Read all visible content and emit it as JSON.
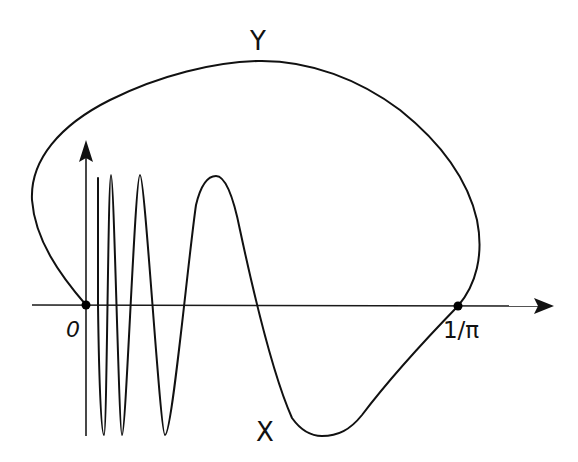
{
  "figure": {
    "width": 578,
    "height": 462,
    "background": "#ffffff",
    "ink": "#111111",
    "labels": {
      "curve_top": "Y",
      "curve_bottom": "X",
      "origin": "0",
      "endpoint": "1/π"
    },
    "axes": {
      "x_axis": {
        "from": [
          32,
          305
        ],
        "to": [
          553,
          306
        ],
        "arrow": "right"
      },
      "y_axis": {
        "from": [
          86,
          436
        ],
        "to": [
          86,
          140
        ],
        "arrow": "up"
      }
    },
    "points": [
      {
        "name": "origin",
        "x": 86,
        "y": 305,
        "label": "0"
      },
      {
        "name": "one-over-pi",
        "x": 458,
        "y": 306,
        "label": "1/π"
      }
    ],
    "curves": {
      "Y": "M 86 305 C 60 275, 35 240, 32 200 C 30 160, 60 125, 110 100 C 160 75, 215 62, 258 61 C 310 60, 360 80, 400 110 C 440 142, 468 180, 477 220 C 484 255, 476 285, 458 306",
      "X": "M 98 178 L 98 305 C 99 380, 101 435, 104 435 C 107 435, 108 175, 111 175 C 114 175, 119 435, 122 435 C 126 435, 135 175, 140 175 C 145 175, 160 435, 165 435 C 172 435, 188 260, 196 205 C 202 180, 210 176, 216 176 C 224 176, 232 190, 240 230 C 255 300, 275 380, 292 418 C 302 432, 312 436, 322 436 C 338 436, 350 430, 362 415 C 390 378, 425 340, 458 306"
    }
  }
}
